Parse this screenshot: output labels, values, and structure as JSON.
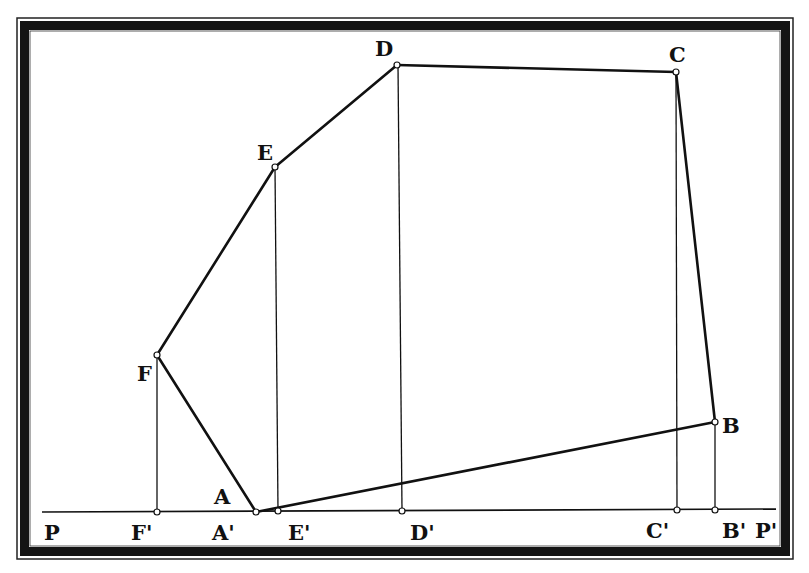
{
  "diagram": {
    "type": "geometric-projection",
    "colors": {
      "background": "#ffffff",
      "stroke": "#111111",
      "border": "#141414"
    },
    "points": {
      "A": {
        "label": "A",
        "x": 256,
        "y": 512
      },
      "B": {
        "label": "B",
        "x": 715,
        "y": 422
      },
      "C": {
        "label": "C",
        "x": 676,
        "y": 72
      },
      "D": {
        "label": "D",
        "x": 397,
        "y": 65
      },
      "E": {
        "label": "E",
        "x": 275,
        "y": 167
      },
      "F": {
        "label": "F",
        "x": 157,
        "y": 355
      }
    },
    "projections": {
      "A'": {
        "label": "A'",
        "x": 256,
        "y": 512
      },
      "B'": {
        "label": "B'",
        "x": 715,
        "y": 510
      },
      "C'": {
        "label": "C'",
        "x": 677,
        "y": 510
      },
      "D'": {
        "label": "D'",
        "x": 402,
        "y": 511
      },
      "E'": {
        "label": "E'",
        "x": 278,
        "y": 511
      },
      "F'": {
        "label": "F'",
        "x": 157,
        "y": 512
      }
    },
    "baseline": {
      "start_label": "P",
      "end_label": "P'"
    },
    "labels": {
      "A": "A",
      "B": "B",
      "C": "C",
      "D": "D",
      "E": "E",
      "F": "F",
      "A_prime": "A'",
      "B_prime": "B'",
      "C_prime": "C'",
      "D_prime": "D'",
      "E_prime": "E'",
      "F_prime": "F'",
      "P": "P",
      "P_prime": "P'"
    }
  }
}
